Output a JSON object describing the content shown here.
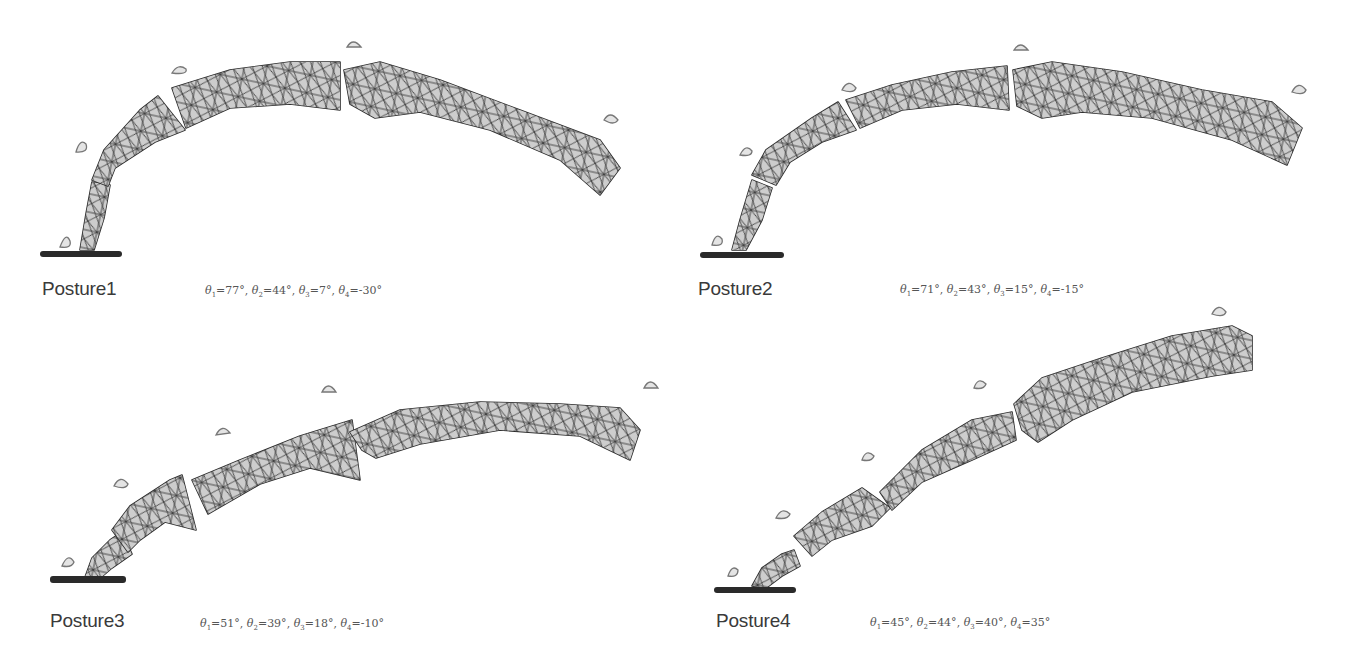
{
  "figure": {
    "panels": [
      {
        "id": "posture1",
        "label": "Posture1",
        "angles": [
          {
            "symbol": "θ",
            "index": "1",
            "value": "77°"
          },
          {
            "symbol": "θ",
            "index": "2",
            "value": "44°"
          },
          {
            "symbol": "θ",
            "index": "3",
            "value": "7°"
          },
          {
            "symbol": "θ",
            "index": "4",
            "value": "-30°"
          }
        ]
      },
      {
        "id": "posture2",
        "label": "Posture2",
        "angles": [
          {
            "symbol": "θ",
            "index": "1",
            "value": "71°"
          },
          {
            "symbol": "θ",
            "index": "2",
            "value": "43°"
          },
          {
            "symbol": "θ",
            "index": "3",
            "value": "15°"
          },
          {
            "symbol": "θ",
            "index": "4",
            "value": "-15°"
          }
        ]
      },
      {
        "id": "posture3",
        "label": "Posture3",
        "angles": [
          {
            "symbol": "θ",
            "index": "1",
            "value": "51°"
          },
          {
            "symbol": "θ",
            "index": "2",
            "value": "39°"
          },
          {
            "symbol": "θ",
            "index": "3",
            "value": "18°"
          },
          {
            "symbol": "θ",
            "index": "4",
            "value": "-10°"
          }
        ]
      },
      {
        "id": "posture4",
        "label": "Posture4",
        "angles": [
          {
            "symbol": "θ",
            "index": "1",
            "value": "45°"
          },
          {
            "symbol": "θ",
            "index": "2",
            "value": "44°"
          },
          {
            "symbol": "θ",
            "index": "3",
            "value": "40°"
          },
          {
            "symbol": "θ",
            "index": "4",
            "value": "35°"
          }
        ]
      }
    ],
    "colors": {
      "mesh_fill": "#cfcfcf",
      "mesh_edge": "#2b2b2b",
      "marker": "#e4e4e4",
      "base": "#2a2a2a",
      "background": "#ffffff"
    }
  }
}
